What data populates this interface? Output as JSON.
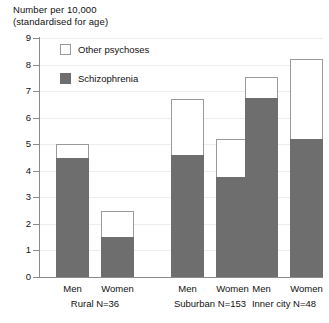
{
  "chart_data": {
    "type": "bar",
    "title": "Number per 10,000\n(standardised for age)",
    "title_line1": "Number per 10,000",
    "title_line2": "(standardised for age)",
    "xlabel": "",
    "ylabel": "Number per 10,000 (standardised for age)",
    "ylim": [
      0,
      9
    ],
    "yticks": [
      "0",
      "1",
      "2",
      "3",
      "4",
      "5",
      "6",
      "7",
      "8",
      "9"
    ],
    "grid": true,
    "stacked": true,
    "legend_position": "top-left-inside",
    "categories": [
      "Men",
      "Women",
      "Men",
      "Women",
      "Men",
      "Women"
    ],
    "groups": [
      {
        "name": "Rural",
        "n_label": "Rural N=36",
        "categories": [
          "Men",
          "Women"
        ]
      },
      {
        "name": "Suburban",
        "n_label": "Suburban N=153",
        "categories": [
          "Men",
          "Women"
        ]
      },
      {
        "name": "Inner city",
        "n_label": "Inner city N=48",
        "categories": [
          "Men",
          "Women"
        ]
      }
    ],
    "series": [
      {
        "name": "Schizophrenia",
        "color": "#6e6e6e",
        "values": [
          4.5,
          1.5,
          4.6,
          3.75,
          6.75,
          5.2
        ]
      },
      {
        "name": "Other psychoses",
        "color": "#ffffff",
        "values": [
          0.5,
          1.0,
          2.1,
          1.45,
          0.8,
          3.0
        ]
      }
    ],
    "totals": [
      5.0,
      2.5,
      6.7,
      5.2,
      7.55,
      8.2
    ]
  },
  "legend": {
    "items": [
      {
        "label": "Other psychoses",
        "swatch": "other"
      },
      {
        "label": "Schizophrenia",
        "swatch": "schiz"
      }
    ]
  },
  "axis": {
    "y_ticks": [
      "9",
      "8",
      "7",
      "6",
      "5",
      "4",
      "3",
      "2",
      "1",
      "0"
    ]
  },
  "colors": {
    "schizophrenia": "#6e6e6e",
    "other_psychoses": "#ffffff",
    "outline": "#9a9a9a",
    "axis": "#8a8a8a",
    "grid": "#ededed",
    "text": "#111111"
  }
}
